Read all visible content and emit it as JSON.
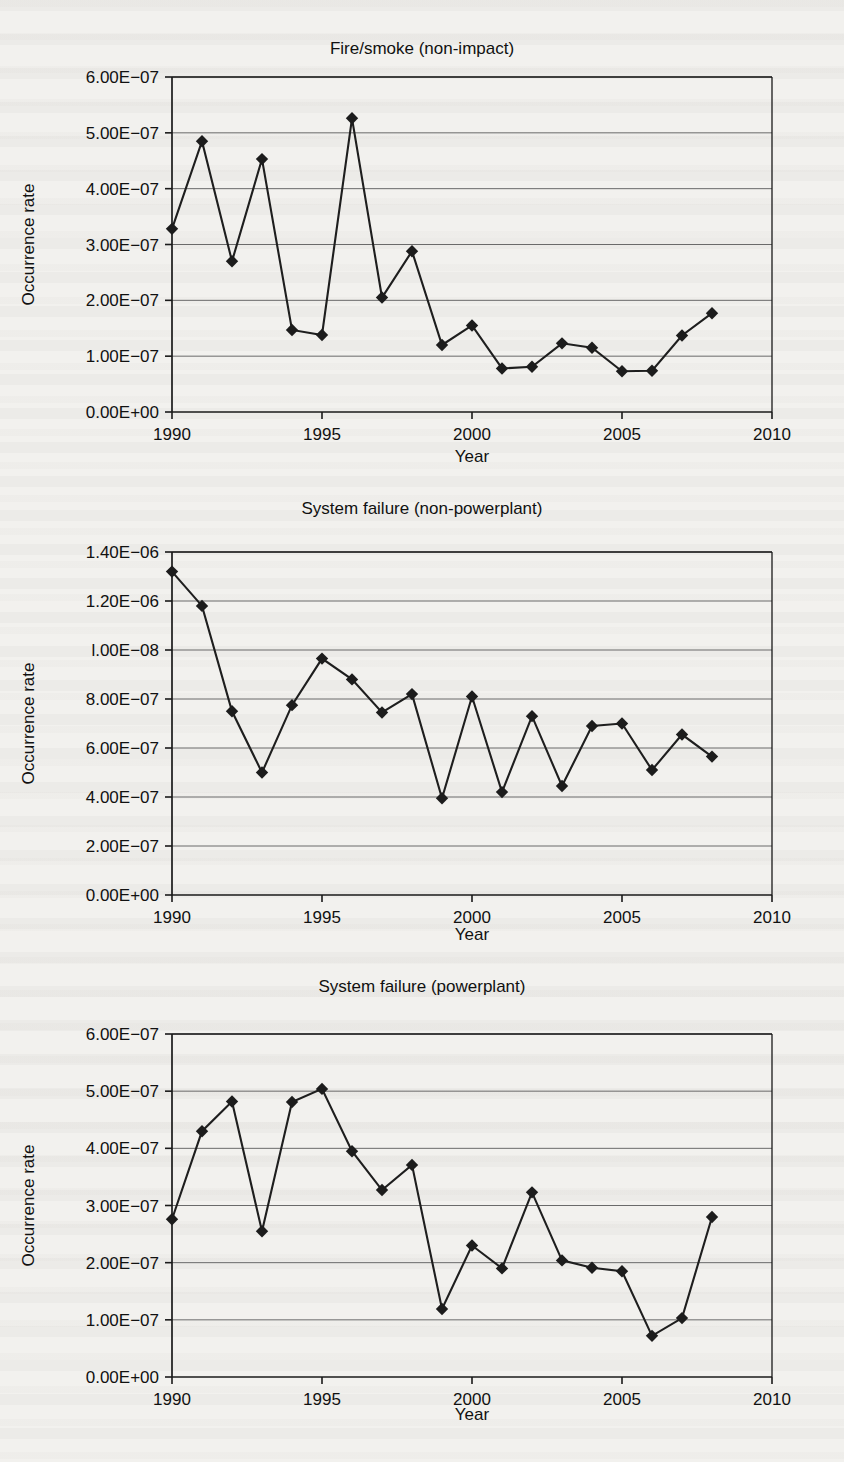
{
  "page": {
    "background_color": "#f2f1ee",
    "ink_color": "#1c1c1c",
    "gridline_color": "#6a6a6a",
    "figure_count": 3
  },
  "chart_data": [
    {
      "id": "fire-smoke-non-impact",
      "type": "line",
      "title": "Fire/smoke (non-impact)",
      "xlabel": "Year",
      "ylabel": "Occurrence rate",
      "grid": true,
      "legend": "none",
      "marker": "diamond",
      "xlim": [
        1990,
        2010
      ],
      "ylim": [
        0,
        6e-07
      ],
      "xticks": [
        1990,
        1995,
        2000,
        2005,
        2010
      ],
      "xtick_labels": [
        "1990",
        "1995",
        "2000",
        "2005",
        "2010"
      ],
      "yticks": [
        0,
        1e-07,
        2e-07,
        3e-07,
        4e-07,
        5e-07,
        6e-07
      ],
      "ytick_labels": [
        "0.00E+00",
        "1.00E−07",
        "2.00E−07",
        "3.00E−07",
        "4.00E−07",
        "5.00E−07",
        "6.00E−07"
      ],
      "x": [
        1990,
        1991,
        1992,
        1993,
        1994,
        1995,
        1996,
        1997,
        1998,
        1999,
        2000,
        2001,
        2002,
        2003,
        2004,
        2005,
        2006,
        2007,
        2008
      ],
      "values": [
        3.28e-07,
        4.85e-07,
        2.7e-07,
        4.53e-07,
        1.47e-07,
        1.38e-07,
        5.26e-07,
        2.05e-07,
        2.88e-07,
        1.2e-07,
        1.55e-07,
        7.8e-08,
        8.1e-08,
        1.23e-07,
        1.15e-07,
        7.3e-08,
        7.4e-08,
        1.37e-07,
        1.77e-07
      ]
    },
    {
      "id": "system-failure-non-powerplant",
      "type": "line",
      "title": "System failure (non-powerplant)",
      "xlabel": "Year",
      "ylabel": "Occurrence rate",
      "grid": true,
      "legend": "none",
      "marker": "diamond",
      "xlim": [
        1990,
        2010
      ],
      "ylim": [
        0,
        1.4e-06
      ],
      "xticks": [
        1990,
        1995,
        2000,
        2005,
        2010
      ],
      "xtick_labels": [
        "1990",
        "1995",
        "2000",
        "2005",
        "2010"
      ],
      "yticks": [
        0,
        2e-07,
        4e-07,
        6e-07,
        8e-07,
        1e-06,
        1.2e-06,
        1.4e-06
      ],
      "ytick_labels": [
        "0.00E+00",
        "2.00E−07",
        "4.00E−07",
        "6.00E−07",
        "8.00E−07",
        "l.00E−08",
        "1.20E−06",
        "1.40E−06"
      ],
      "x": [
        1990,
        1991,
        1992,
        1993,
        1994,
        1995,
        1996,
        1997,
        1998,
        1999,
        2000,
        2001,
        2002,
        2003,
        2004,
        2005,
        2006,
        2007,
        2008
      ],
      "values": [
        1.32e-06,
        1.18e-06,
        7.5e-07,
        5e-07,
        7.75e-07,
        9.65e-07,
        8.8e-07,
        7.45e-07,
        8.2e-07,
        3.95e-07,
        8.1e-07,
        4.2e-07,
        7.3e-07,
        4.45e-07,
        6.9e-07,
        7e-07,
        5.1e-07,
        6.55e-07,
        5.65e-07
      ]
    },
    {
      "id": "system-failure-powerplant",
      "type": "line",
      "title": "System failure (powerplant)",
      "xlabel": "Year",
      "ylabel": "Occurrence rate",
      "grid": true,
      "legend": "none",
      "marker": "diamond",
      "xlim": [
        1990,
        2010
      ],
      "ylim": [
        0,
        6e-07
      ],
      "xticks": [
        1990,
        1995,
        2000,
        2005,
        2010
      ],
      "xtick_labels": [
        "1990",
        "1995",
        "2000",
        "2005",
        "2010"
      ],
      "yticks": [
        0,
        1e-07,
        2e-07,
        3e-07,
        4e-07,
        5e-07,
        6e-07
      ],
      "ytick_labels": [
        "0.00E+00",
        "1.00E−07",
        "2.00E−07",
        "3.00E−07",
        "4.00E−07",
        "5.00E−07",
        "6.00E−07"
      ],
      "x": [
        1990,
        1991,
        1992,
        1993,
        1994,
        1995,
        1996,
        1997,
        1998,
        1999,
        2000,
        2001,
        2002,
        2003,
        2004,
        2005,
        2006,
        2007,
        2008
      ],
      "values": [
        2.76e-07,
        4.3e-07,
        4.82e-07,
        2.55e-07,
        4.81e-07,
        5.04e-07,
        3.95e-07,
        3.27e-07,
        3.71e-07,
        1.19e-07,
        2.3e-07,
        1.9e-07,
        3.23e-07,
        2.04e-07,
        1.91e-07,
        1.85e-07,
        7.2e-08,
        1.03e-07,
        2.8e-07
      ]
    }
  ]
}
